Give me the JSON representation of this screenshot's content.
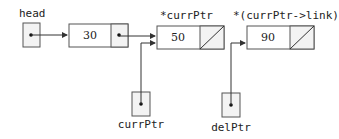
{
  "diagram": {
    "labels": {
      "head": "head",
      "curr_node": "*currPtr",
      "next_node": "*(currPtr->link)",
      "curr_ptr": "currPtr",
      "del_ptr": "delPtr"
    },
    "nodes": [
      {
        "id": "n1",
        "value": "30",
        "link": "pointer"
      },
      {
        "id": "n2",
        "value": "50",
        "link": "null"
      },
      {
        "id": "n3",
        "value": "90",
        "link": "null"
      }
    ],
    "edges": [
      {
        "from": "head",
        "to": "n1"
      },
      {
        "from": "n1",
        "to": "n2"
      },
      {
        "from": "currPtr",
        "to": "n2"
      },
      {
        "from": "delPtr",
        "to": "n3"
      }
    ],
    "colors": {
      "stroke": "#555555",
      "pointer_fill": "#f3f3f3",
      "text": "#222222"
    }
  }
}
